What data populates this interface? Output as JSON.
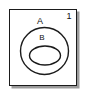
{
  "diagram": {
    "type": "euler-venn-diagram",
    "universal_set": {
      "label": "1",
      "shape": "rectangle"
    },
    "sets": [
      {
        "id": "A",
        "label": "A",
        "shape": "ellipse",
        "relation": "contains B"
      },
      {
        "id": "B",
        "label": "B",
        "shape": "ellipse",
        "relation": "subset of A"
      }
    ],
    "colors": {
      "stroke": "#1b1b1b",
      "fill": "#ffffff",
      "shadow": "#9b9b9b",
      "text": "#111111"
    },
    "geometry": {
      "frame": {
        "x": 9,
        "y": 9,
        "width": 68,
        "height": 77
      },
      "ellipse_a": {
        "cx": 44.5,
        "cy": 51,
        "rx": 24,
        "ry": 23.5
      },
      "ellipse_b": {
        "cx": 45,
        "cy": 55.5,
        "rx": 15.5,
        "ry": 9.5
      }
    }
  }
}
